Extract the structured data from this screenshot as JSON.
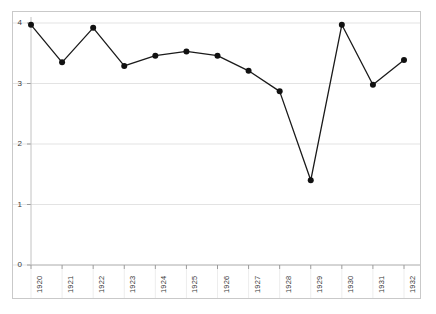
{
  "chart_data": {
    "type": "line",
    "title": "",
    "subtitle": "",
    "xlabel": "",
    "ylabel": "",
    "categories": [
      "1920",
      "1921",
      "1922",
      "1923",
      "1924",
      "1925",
      "1926",
      "1927",
      "1928",
      "1929",
      "1930",
      "1931",
      "1932"
    ],
    "x": [
      1920,
      1921,
      1922,
      1923,
      1924,
      1925,
      1926,
      1927,
      1928,
      1929,
      1930,
      1931,
      1932
    ],
    "values": [
      3.97,
      3.35,
      3.92,
      3.29,
      3.46,
      3.53,
      3.46,
      3.21,
      2.87,
      1.4,
      3.97,
      2.98,
      3.39
    ],
    "series": [
      {
        "name": "series-1",
        "values": [
          3.97,
          3.35,
          3.92,
          3.29,
          3.46,
          3.53,
          3.46,
          3.21,
          2.87,
          1.4,
          3.97,
          2.98,
          3.39
        ]
      }
    ],
    "ylim": [
      0,
      4
    ],
    "xlim": [
      1920,
      1932
    ],
    "y_ticks": [
      0,
      1,
      2,
      3,
      4
    ],
    "y_tick_labels": [
      "0",
      "1",
      "2",
      "3",
      "4"
    ],
    "x_tick_labels": [
      "1920",
      "1921",
      "1922",
      "1923",
      "1924",
      "1925",
      "1926",
      "1927",
      "1928",
      "1929",
      "1930",
      "1931",
      "1932"
    ],
    "grid": true,
    "grid_axis": "y",
    "legend": false,
    "legend_position": "none",
    "marker": "circle",
    "line_color": "#1a1a1a",
    "marker_color": "#111111",
    "grid_color": "#e3e3e3",
    "frame_color": "#c9c9c9",
    "background_color": "#ffffff",
    "x_tick_label_rotation": "-90"
  },
  "axes": {
    "y_axis_name": "y-axis",
    "x_axis_name": "x-axis"
  }
}
